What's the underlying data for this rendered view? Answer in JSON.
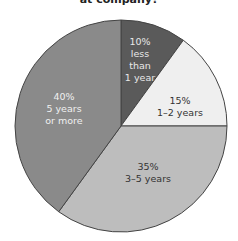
{
  "chart_data": {
    "type": "pie",
    "title": "at company?",
    "categories": [
      "less than 1 year",
      "1–2 years",
      "3–5 years",
      "5 years or more"
    ],
    "values": [
      10,
      15,
      35,
      40
    ],
    "labels": [
      {
        "pct": "10%",
        "lines": [
          "less",
          "than",
          "1 year"
        ]
      },
      {
        "pct": "15%",
        "lines": [
          "1–2 years"
        ]
      },
      {
        "pct": "35%",
        "lines": [
          "3–5 years"
        ]
      },
      {
        "pct": "40%",
        "lines": [
          "5 years",
          "or more"
        ]
      }
    ],
    "colors": [
      "#5a5a5a",
      "#efefef",
      "#bdbdbd",
      "#8a8a8a"
    ],
    "label_colors": [
      "#e8e8e8",
      "#333333",
      "#333333",
      "#f0f0f0"
    ],
    "start_angle": "12 o'clock, clockwise",
    "legend": "none (inline labels)"
  }
}
